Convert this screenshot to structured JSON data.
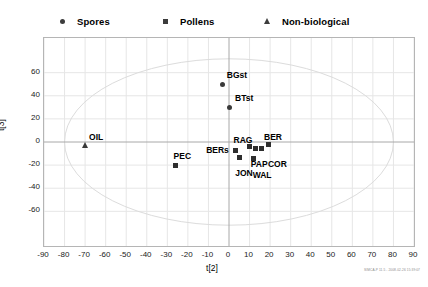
{
  "legend": {
    "entries": [
      {
        "label": "Spores",
        "marker": "circle",
        "icon": "circle-marker-icon",
        "x": 57
      },
      {
        "label": "Pollens",
        "marker": "square",
        "icon": "square-marker-icon",
        "x": 160
      },
      {
        "label": "Non-biological",
        "marker": "triangle",
        "icon": "triangle-marker-icon",
        "x": 262
      }
    ]
  },
  "watermark": "SIMCA-P 11.5 - 2008-02-26 15:39:07",
  "chart_data": {
    "type": "scatter",
    "title": "",
    "xlabel": "t[2]",
    "ylabel": "t[3]",
    "xlim": [
      -90,
      90
    ],
    "ylim": [
      -90,
      90
    ],
    "xticks": [
      -90,
      -80,
      -70,
      -60,
      -50,
      -40,
      -30,
      -20,
      -10,
      0,
      10,
      20,
      30,
      40,
      50,
      60,
      70,
      80,
      90
    ],
    "yticks": [
      60,
      40,
      20,
      0,
      -20,
      -40,
      -60
    ],
    "grid": true,
    "legend_position": "top",
    "confidence_ellipse": {
      "rx": 80,
      "ry": 72,
      "cx": 0,
      "cy": 0
    },
    "series": [
      {
        "name": "Spores",
        "marker": "circle",
        "points": [
          {
            "label": "BGst",
            "x": -3,
            "y": 50,
            "label_dx": 4,
            "label_dy": -13
          },
          {
            "label": "BTst",
            "x": 0,
            "y": 30,
            "label_dx": 6,
            "label_dy": -13
          }
        ]
      },
      {
        "name": "Pollens",
        "marker": "square",
        "points": [
          {
            "label": "PEC",
            "x": -26,
            "y": -20,
            "label_dx": -2,
            "label_dy": -13
          },
          {
            "label": "BERs",
            "x": 3,
            "y": -7,
            "label_dx": -29,
            "label_dy": -4
          },
          {
            "label": "RAG",
            "x": 10,
            "y": -4,
            "label_dx": -16,
            "label_dy": -11
          },
          {
            "label": "PAP",
            "x": 13,
            "y": -6,
            "label_dx": -5,
            "label_dy": 11
          },
          {
            "label": "COR",
            "x": 16,
            "y": -6,
            "label_dx": 6,
            "label_dy": 11
          },
          {
            "label": "BER",
            "x": 19,
            "y": -2,
            "label_dx": -4,
            "label_dy": -11
          },
          {
            "label": "JON",
            "x": 5,
            "y": -13,
            "label_dx": -4,
            "label_dy": 12
          },
          {
            "label": "WAL",
            "x": 12,
            "y": -14,
            "label_dx": -1,
            "label_dy": 13
          }
        ]
      },
      {
        "name": "Non-biological",
        "marker": "triangle",
        "points": [
          {
            "label": "OIL",
            "x": -70,
            "y": -3,
            "label_dx": 4,
            "label_dy": -12
          }
        ]
      }
    ]
  }
}
